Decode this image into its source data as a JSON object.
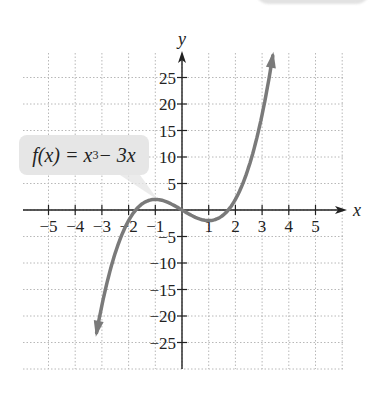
{
  "chart_data": {
    "type": "line",
    "title": "",
    "function_label": "f(x) = x³ − 3x",
    "function_label_parts": {
      "prefix": "f(x) = x",
      "exponent": "3",
      "suffix": " − 3x"
    },
    "xlabel": "x",
    "ylabel": "y",
    "xlim": [
      -6,
      6
    ],
    "ylim": [
      -30,
      30
    ],
    "x_ticks": [
      -5,
      -4,
      -3,
      -2,
      -1,
      1,
      2,
      3,
      4,
      5
    ],
    "x_tick_labels": [
      "−5",
      "−4",
      "−3",
      "−2",
      "−1",
      "1",
      "2",
      "3",
      "4",
      "5"
    ],
    "y_ticks": [
      25,
      20,
      15,
      10,
      5,
      -5,
      -10,
      -15,
      -20,
      -25
    ],
    "y_tick_labels": [
      "25",
      "20",
      "15",
      "10",
      "5",
      "−5",
      "−10",
      "−15",
      "−20",
      "−25"
    ],
    "grid": true,
    "series": [
      {
        "name": "f(x) = x³ − 3x",
        "x": [
          -3.2,
          -3,
          -2.5,
          -2,
          -1.5,
          -1,
          -0.5,
          0,
          0.5,
          1,
          1.5,
          2,
          2.5,
          3,
          3.4
        ],
        "values": [
          -23.17,
          -18,
          -8.13,
          -2,
          1.13,
          2,
          1.38,
          0,
          -1.38,
          -2,
          -1.13,
          2,
          8.13,
          18,
          29.1
        ],
        "color": "#7a7a7a"
      }
    ],
    "annotations": [
      "Local max at (−1, 2)",
      "Local min at (1, −2)",
      "Arrows indicate curve continues"
    ]
  },
  "colors": {
    "curve": "#7a7a7a",
    "axis": "#222222",
    "grid": "#b8b8b8",
    "callout_bg": "#e6e6e6"
  }
}
